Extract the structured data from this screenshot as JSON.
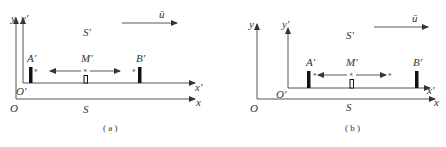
{
  "figure": {
    "panels": [
      {
        "id": "a",
        "caption": "( a )",
        "frame_S": {
          "label": "S",
          "origin_label": "O",
          "x_label": "x",
          "y_label": "y"
        },
        "frame_S_prime": {
          "label": "S'",
          "origin_label": "O'",
          "x_label": "x'",
          "y_label": "y'"
        },
        "velocity_label": "ū",
        "points": [
          {
            "name": "A'",
            "label": "A'"
          },
          {
            "name": "M'",
            "label": "M'"
          },
          {
            "name": "B'",
            "label": "B'"
          }
        ],
        "light_signals": {
          "star": "*",
          "description": "signals emitted from M' toward A' and B'"
        }
      },
      {
        "id": "b",
        "caption": "( b )",
        "frame_S": {
          "label": "S",
          "origin_label": "O",
          "x_label": "x",
          "y_label": "y"
        },
        "frame_S_prime": {
          "label": "S'",
          "origin_label": "O'",
          "x_label": "x'",
          "y_label": "y'"
        },
        "velocity_label": "ū",
        "points": [
          {
            "name": "A'",
            "label": "A'"
          },
          {
            "name": "M'",
            "label": "M'"
          },
          {
            "name": "B'",
            "label": "B'"
          }
        ],
        "light_signals": {
          "star": "*",
          "description": "signals traveling from M' toward A' and B'"
        }
      }
    ]
  }
}
